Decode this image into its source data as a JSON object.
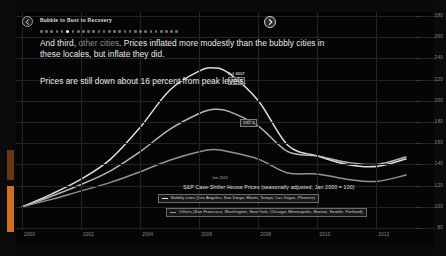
{
  "header": {
    "title": "Bubble to Bust to Recovery",
    "prev_icon": "chevron-left-icon",
    "next_icon": "chevron-right-icon",
    "dot_count": 27,
    "active_dot_index": 5
  },
  "narrative": {
    "para1_a": "And third, ",
    "para1_b": "other cities",
    "para1_c": ". Prices inflated more modestly than the bubbly cities in these locales, but inflate they did.",
    "para2": "Prices are still down about 16 percent from peak levels."
  },
  "annotations": {
    "peak_label": "Jul 2007",
    "peak_value": "226.3",
    "mid_label": "Jun 2006",
    "mid_value": "192.3",
    "legend_tag": "Jun 2012"
  },
  "legend": {
    "chart_title": "S&P Case-Shiller House Prices (seasonally adjusted, Jan 2000 = 100)",
    "bubbly_label": "Bubbly cities (Los Angeles, San Diego, Miami, Tampa, Las Vegas, Phoenix)",
    "others_label": "Others (San Francisco, Washington, New York, Chicago, Minneapolis, Boston, Seattle, Portland)",
    "bubbly_color": "#e8e8e8",
    "others_color": "#9a9a9a"
  },
  "chart_data": {
    "type": "line",
    "title": "S&P Case-Shiller House Prices (seasonally adjusted, Jan 2000 = 100)",
    "xlabel": "",
    "ylabel": "Index (Jan 2000 = 100)",
    "xlim": [
      2000,
      2013
    ],
    "ylim": [
      80,
      280
    ],
    "ytick_step": 20,
    "yticks": [
      280,
      260,
      240,
      220,
      200,
      180,
      160,
      140,
      120,
      100,
      80
    ],
    "xticks": [
      2000,
      2002,
      2004,
      2006,
      2008,
      2010,
      2012
    ],
    "xtick_labels": [
      "2000",
      "2002",
      "2004",
      "2006",
      "2008",
      "2010",
      "2012"
    ],
    "grid": true,
    "legend_position": "bottom-right",
    "axis_side": "right",
    "series": [
      {
        "name": "Bubbly cities (Los Angeles, San Diego, Miami, Tampa, Las Vegas, Phoenix)",
        "color": "#e8e8e8",
        "x": [
          2000,
          2001,
          2002,
          2003,
          2004,
          2005,
          2006,
          2006.5,
          2007,
          2008,
          2009,
          2010,
          2011,
          2012,
          2013
        ],
        "values": [
          100,
          112,
          126,
          145,
          175,
          210,
          228,
          231,
          226,
          200,
          158,
          148,
          140,
          138,
          145
        ]
      },
      {
        "name": "Composite / national",
        "color": "#c0c0c0",
        "x": [
          2000,
          2001,
          2002,
          2003,
          2004,
          2005,
          2006,
          2006.5,
          2007,
          2008,
          2009,
          2010,
          2011,
          2012,
          2013
        ],
        "values": [
          100,
          110,
          121,
          134,
          152,
          173,
          188,
          192,
          190,
          176,
          152,
          148,
          142,
          140,
          147
        ]
      },
      {
        "name": "Others (San Francisco, Washington, New York, Chicago, Minneapolis, Boston, Seattle, Portland)",
        "color": "#9a9a9a",
        "x": [
          2000,
          2001,
          2002,
          2003,
          2004,
          2005,
          2006,
          2006.5,
          2007,
          2008,
          2009,
          2010,
          2011,
          2012,
          2013
        ],
        "values": [
          100,
          107,
          115,
          123,
          133,
          144,
          152,
          154,
          152,
          145,
          132,
          131,
          126,
          124,
          130
        ]
      }
    ]
  }
}
